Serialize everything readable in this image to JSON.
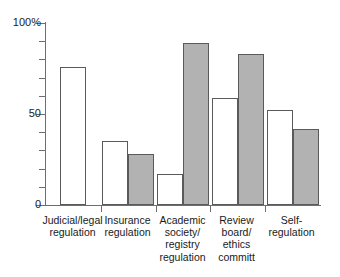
{
  "chart_data": {
    "type": "bar",
    "title": "",
    "subtitle": "",
    "xlabel": "",
    "ylabel": "",
    "ylim": [
      0,
      100
    ],
    "yticks": [
      0,
      10,
      20,
      30,
      40,
      50,
      60,
      70,
      80,
      90,
      100
    ],
    "ytick_labels": {
      "0": "0",
      "50": "50",
      "100": "100%"
    },
    "grid": false,
    "legend_position": "none",
    "categories": [
      "Judicial/legal regulation",
      "Insurance regulation",
      "Academic society/ registry regulation",
      "Review board/ ethics committ",
      "Self- regulation"
    ],
    "category_lines": [
      [
        "Judicial/legal",
        "regulation"
      ],
      [
        "Insurance",
        "regulation"
      ],
      [
        "Academic",
        "society/",
        "registry",
        "regulation"
      ],
      [
        "Review",
        "board/",
        "ethics",
        "committ"
      ],
      [
        "Self-",
        "regulation"
      ]
    ],
    "series": [
      {
        "name": "white",
        "fill": "#ffffff",
        "values": [
          76,
          35,
          17,
          59,
          52
        ]
      },
      {
        "name": "gray",
        "fill": "#b2b2b2",
        "values": [
          null,
          28,
          89,
          83,
          42
        ]
      }
    ],
    "colors": {
      "white_bar": "#ffffff",
      "gray_bar": "#b2b2b2",
      "bar_outline": "#5a5a5a",
      "axis": "#6e6e6e",
      "text": "#1a1a1a",
      "background": "#ffffff"
    }
  },
  "axis": {
    "y_label_100": "100%",
    "y_label_50": "50",
    "y_label_0": "0"
  }
}
